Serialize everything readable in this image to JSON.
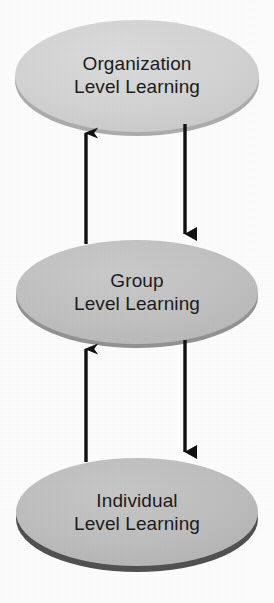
{
  "diagram": {
    "type": "cycle-flow",
    "background_color": "#fefefe",
    "nodes": [
      {
        "id": "organization",
        "shape": "ellipse",
        "line1": "Organization",
        "line2": "Level Learning",
        "fill_color": "#d5d5d5",
        "rim_color": "#a9a9a9",
        "text_color": "#1c1c1c",
        "cx": 137,
        "cy": 76,
        "rx": 122,
        "ry": 56
      },
      {
        "id": "group",
        "shape": "ellipse",
        "line1": "Group",
        "line2": "Level Learning",
        "fill_color": "#c3c3c3",
        "rim_color": "#949494",
        "text_color": "#1c1c1c",
        "cx": 137,
        "cy": 292,
        "rx": 121,
        "ry": 52
      },
      {
        "id": "individual",
        "shape": "ellipse",
        "line1": "Individual",
        "line2": "Level Learning",
        "fill_color": "#c0c0c0",
        "rim_color": "#4a4a4a",
        "text_color": "#1c1c1c",
        "cx": 137,
        "cy": 512,
        "rx": 121,
        "ry": 54
      }
    ],
    "arrows": [
      {
        "id": "group-to-organization",
        "direction": "up",
        "from": "group",
        "to": "organization",
        "color": "#111111",
        "x": 86,
        "y_start": 244,
        "y_end": 131
      },
      {
        "id": "organization-to-group",
        "direction": "down",
        "from": "organization",
        "to": "group",
        "color": "#111111",
        "x": 185,
        "y_start": 124,
        "y_end": 237
      },
      {
        "id": "individual-to-group",
        "direction": "up",
        "from": "individual",
        "to": "group",
        "color": "#111111",
        "x": 86,
        "y_start": 462,
        "y_end": 347
      },
      {
        "id": "group-to-individual",
        "direction": "down",
        "from": "group",
        "to": "individual",
        "color": "#111111",
        "x": 185,
        "y_start": 340,
        "y_end": 455
      }
    ]
  }
}
